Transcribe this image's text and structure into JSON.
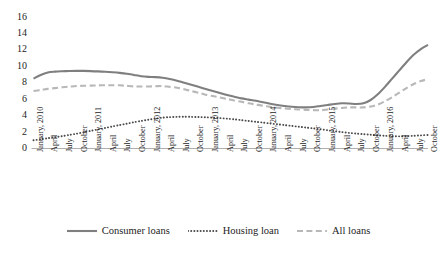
{
  "chart_data": {
    "type": "line",
    "title": "",
    "xlabel": "",
    "ylabel": "",
    "ylim": [
      0,
      16
    ],
    "ytick_step": 2,
    "yticks": [
      16,
      14,
      12,
      10,
      8,
      6,
      4,
      2,
      0
    ],
    "grid": false,
    "legend_position": "bottom",
    "categories": [
      "January, 2010",
      "April",
      "July",
      "October",
      "January, 2011",
      "April",
      "July",
      "October",
      "January, 2012",
      "April",
      "July",
      "October",
      "January, 2013",
      "April",
      "July",
      "October",
      "January, 2014",
      "April",
      "July",
      "October",
      "January, 2015",
      "April",
      "July",
      "October",
      "January, 2016",
      "April",
      "July",
      "October"
    ],
    "series": [
      {
        "name": "Consumer loans",
        "style": "solid",
        "color": "#808080",
        "values": [
          8.5,
          9.2,
          9.4,
          9.4,
          9.3,
          9.2,
          9.0,
          8.5,
          8.4,
          8.3,
          7.9,
          7.3,
          6.8,
          6.4,
          6.1,
          5.7,
          5.4,
          5.2,
          5.0,
          5.2,
          5.4,
          5.3,
          5.5,
          5.6,
          5.8,
          5.9,
          6.1,
          6.3
        ]
      },
      {
        "name": "Housing loan",
        "style": "dotted",
        "color": "#4d4d4d",
        "values": [
          1.0,
          1.3,
          1.6,
          1.9,
          2.2,
          2.5,
          2.9,
          3.3,
          3.6,
          3.8,
          3.8,
          3.7,
          3.6,
          3.4,
          3.2,
          3.0,
          2.8,
          2.6,
          2.4,
          2.2,
          2.0,
          1.9,
          1.8,
          1.7,
          1.6,
          1.5,
          1.4,
          1.35
        ]
      },
      {
        "name": "All loans",
        "style": "dashed",
        "color": "#b3b3b3",
        "values": [
          7.0,
          7.3,
          7.5,
          7.6,
          7.6,
          7.6,
          7.7,
          7.3,
          7.4,
          7.5,
          7.1,
          6.6,
          6.2,
          5.9,
          5.6,
          5.3,
          5.1,
          4.9,
          4.7,
          4.8,
          4.9,
          4.8,
          5.0,
          5.1,
          5.2,
          5.3,
          5.4,
          5.5
        ]
      }
    ],
    "series_full": [
      {
        "name": "Consumer loans",
        "style": "solid",
        "values": [
          8.5,
          9.2,
          9.4,
          9.45,
          9.4,
          9.35,
          9.2,
          9.1,
          8.9,
          8.6,
          8.6,
          8.4,
          8.0,
          7.6,
          7.2,
          6.9,
          6.4,
          6.1,
          6.0,
          5.7,
          5.4,
          5.2,
          5.05,
          5.1,
          5.3,
          5.25,
          5.5,
          5.6
        ]
      }
    ]
  },
  "legend": {
    "items": [
      {
        "label": "Consumer loans",
        "style": "solid",
        "color": "#808080"
      },
      {
        "label": "Housing loan",
        "style": "dotted",
        "color": "#4d4d4d"
      },
      {
        "label": "All loans",
        "style": "dashed",
        "color": "#b3b3b3"
      }
    ]
  }
}
